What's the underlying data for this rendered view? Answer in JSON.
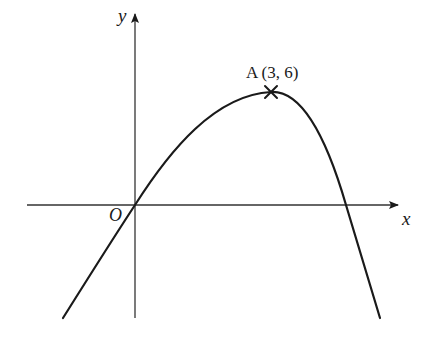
{
  "diagram": {
    "type": "cubic-like curve sketch",
    "axes": {
      "x_label": "x",
      "y_label": "y",
      "origin_label": "O"
    },
    "point_A": {
      "label": "A (3, 6)",
      "name": "A",
      "x": 3,
      "y": 6,
      "marker": "cross"
    },
    "colors": {
      "curve": "#1a1a1a",
      "axes": "#333333",
      "background": "#ffffff"
    }
  }
}
